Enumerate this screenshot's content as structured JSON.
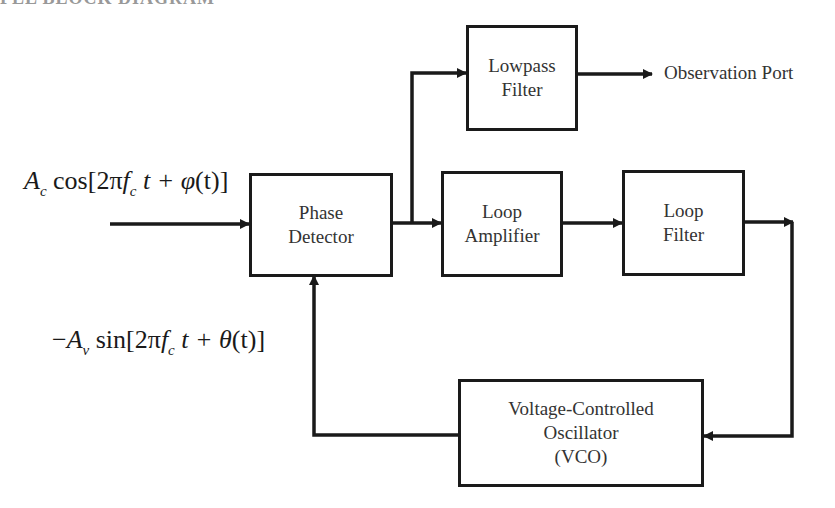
{
  "header": {
    "clipped_title": "PLL BLOCK DIAGRAM"
  },
  "blocks": {
    "phase_detector": {
      "lines": [
        "Phase",
        "Detector"
      ]
    },
    "lowpass_filter": {
      "lines": [
        "Lowpass",
        "Filter"
      ]
    },
    "loop_amplifier": {
      "lines": [
        "Loop",
        "Amplifier"
      ]
    },
    "loop_filter": {
      "lines": [
        "Loop",
        "Filter"
      ]
    },
    "vco": {
      "lines": [
        "Voltage-Controlled",
        "Oscillator",
        "(VCO)"
      ]
    }
  },
  "signals": {
    "input": {
      "amp": "A",
      "amp_sub": "c",
      "func": "cos[2π",
      "freq": "f",
      "freq_sub": "c",
      "rest": "t + ",
      "phase": "φ",
      "phase_arg": "(t)]"
    },
    "feedback": {
      "prefix": "−",
      "amp": "A",
      "amp_sub": "v",
      "func": "sin[2π",
      "freq": "f",
      "freq_sub": "c",
      "rest": "t + ",
      "phase": "θ",
      "phase_arg": "(t)]"
    },
    "output": {
      "label": "Observation Port"
    }
  },
  "colors": {
    "line": "#1a1a1a",
    "text": "#333333",
    "background": "#ffffff"
  }
}
